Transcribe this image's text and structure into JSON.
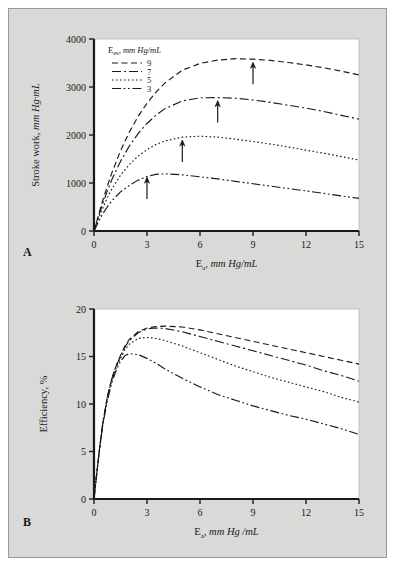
{
  "figure": {
    "background_color": "#d9d9d7",
    "plot_background_color": "#ffffff",
    "border_color": "#9a9a98",
    "line_color": "#1a1a1a",
    "panel_a_label": "A",
    "panel_b_label": "B"
  },
  "legend": {
    "title_main": "E",
    "title_sub": "es",
    "title_rest": ", mm Hg/mL",
    "entries": [
      {
        "label": "9",
        "style": "dashed"
      },
      {
        "label": "7",
        "style": "dash-dot"
      },
      {
        "label": "5",
        "style": "dotted"
      },
      {
        "label": "3",
        "style": "dash-dot-dot"
      }
    ]
  },
  "chart_data": [
    {
      "type": "line",
      "panel": "A",
      "title": "",
      "xlabel_main": "E",
      "xlabel_sub": "a",
      "xlabel_rest": ", mm Hg/mL",
      "ylabel_main": "Stroke work, ",
      "ylabel_ital": "mm Hg·mL",
      "xlim": [
        0,
        15
      ],
      "ylim": [
        0,
        4000
      ],
      "xticks": [
        0,
        3,
        6,
        9,
        12,
        15
      ],
      "yticks": [
        0,
        1000,
        2000,
        3000,
        4000
      ],
      "grid": false,
      "legend_position": "top-left-inside",
      "annotations": [
        {
          "type": "arrow",
          "x": 9,
          "y": 3580,
          "series": "9"
        },
        {
          "type": "arrow",
          "x": 7,
          "y": 2780,
          "series": "7"
        },
        {
          "type": "arrow",
          "x": 5,
          "y": 1960,
          "series": "5"
        },
        {
          "type": "arrow",
          "x": 3,
          "y": 1185,
          "series": "3"
        }
      ],
      "x": [
        0,
        0.25,
        0.5,
        0.75,
        1,
        1.5,
        2,
        2.5,
        3,
        3.5,
        4,
        5,
        6,
        7,
        8,
        9,
        10,
        11,
        12,
        13,
        14,
        15
      ],
      "series": [
        {
          "name": "9",
          "style": "dashed",
          "values": [
            0,
            330,
            640,
            930,
            1200,
            1670,
            2060,
            2390,
            2660,
            2890,
            3080,
            3350,
            3490,
            3560,
            3590,
            3580,
            3555,
            3510,
            3460,
            3400,
            3330,
            3250
          ]
        },
        {
          "name": "7",
          "style": "dash-dot",
          "values": [
            0,
            300,
            575,
            830,
            1060,
            1450,
            1770,
            2030,
            2240,
            2410,
            2545,
            2710,
            2775,
            2780,
            2765,
            2730,
            2680,
            2620,
            2560,
            2490,
            2410,
            2330
          ]
        },
        {
          "name": "5",
          "style": "dotted",
          "values": [
            0,
            255,
            480,
            690,
            870,
            1160,
            1385,
            1560,
            1695,
            1800,
            1875,
            1955,
            1975,
            1955,
            1915,
            1865,
            1810,
            1750,
            1685,
            1620,
            1550,
            1480
          ]
        },
        {
          "name": "3",
          "style": "dash-dot-dot",
          "values": [
            0,
            190,
            360,
            500,
            625,
            815,
            950,
            1060,
            1135,
            1180,
            1190,
            1170,
            1130,
            1085,
            1035,
            985,
            935,
            885,
            835,
            785,
            730,
            680
          ]
        }
      ]
    },
    {
      "type": "line",
      "panel": "B",
      "title": "",
      "xlabel_main": "E",
      "xlabel_sub": "a",
      "xlabel_rest": ", mm Hg /mL",
      "ylabel": "Efficiency, %",
      "xlim": [
        0,
        15
      ],
      "ylim": [
        0,
        20
      ],
      "xticks": [
        0,
        3,
        6,
        9,
        12,
        15
      ],
      "yticks": [
        0,
        5,
        10,
        15,
        20
      ],
      "grid": false,
      "legend_position": "none",
      "x": [
        0,
        0.15,
        0.3,
        0.5,
        0.75,
        1,
        1.25,
        1.5,
        1.75,
        2,
        2.5,
        3,
        3.5,
        4,
        5,
        6,
        7,
        8,
        9,
        10,
        11,
        12,
        13,
        14,
        15
      ],
      "series": [
        {
          "name": "9",
          "style": "dashed",
          "values": [
            0,
            2.6,
            5.1,
            8.0,
            10.7,
            12.6,
            14.0,
            15.1,
            16.1,
            16.8,
            17.6,
            18.0,
            18.15,
            18.2,
            18.1,
            17.8,
            17.4,
            17.0,
            16.6,
            16.2,
            15.8,
            15.4,
            15.0,
            14.6,
            14.2
          ]
        },
        {
          "name": "7",
          "style": "dash-dot",
          "values": [
            0,
            2.6,
            5.1,
            8.0,
            10.7,
            12.6,
            14.0,
            15.0,
            16.0,
            16.7,
            17.5,
            17.9,
            18.0,
            17.95,
            17.6,
            17.1,
            16.6,
            16.1,
            15.6,
            15.1,
            14.6,
            14.1,
            13.5,
            13.0,
            12.4
          ]
        },
        {
          "name": "5",
          "style": "dotted",
          "values": [
            0,
            2.6,
            5.1,
            8.0,
            10.6,
            12.5,
            13.8,
            14.8,
            15.7,
            16.3,
            16.9,
            17.0,
            16.9,
            16.7,
            16.1,
            15.4,
            14.7,
            14.0,
            13.4,
            12.8,
            12.3,
            11.8,
            11.3,
            10.7,
            10.2
          ]
        },
        {
          "name": "3",
          "style": "dash-dot-dot",
          "values": [
            0,
            2.6,
            5.0,
            7.8,
            10.3,
            12.2,
            13.5,
            14.5,
            15.1,
            15.3,
            15.2,
            14.8,
            14.3,
            13.7,
            12.7,
            11.8,
            11.0,
            10.4,
            9.8,
            9.3,
            8.8,
            8.4,
            7.9,
            7.4,
            6.8
          ]
        }
      ]
    }
  ]
}
